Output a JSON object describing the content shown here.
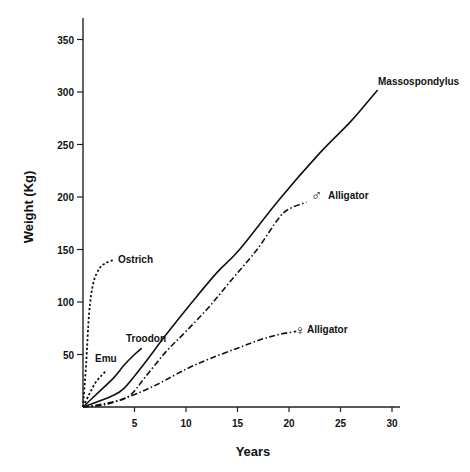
{
  "chart_data": {
    "type": "line",
    "title": "",
    "xlabel": "Years",
    "ylabel": "Weight (Kg)",
    "xlim": [
      0,
      31
    ],
    "ylim": [
      0,
      360
    ],
    "xticks": [
      5,
      10,
      15,
      20,
      25,
      30
    ],
    "yticks": [
      50,
      100,
      150,
      200,
      250,
      300,
      350
    ],
    "grid": false,
    "legend": "inline labels at curve ends",
    "series": [
      {
        "name": "Ostrich",
        "style": "dotted",
        "points": [
          [
            0,
            0
          ],
          [
            0.3,
            40
          ],
          [
            0.6,
            90
          ],
          [
            1.0,
            118
          ],
          [
            1.6,
            132
          ],
          [
            2.2,
            137
          ],
          [
            2.9,
            140
          ]
        ]
      },
      {
        "name": "Emu",
        "style": "dotted",
        "points": [
          [
            0,
            0
          ],
          [
            0.6,
            12
          ],
          [
            1.2,
            23
          ],
          [
            1.8,
            30
          ],
          [
            2.3,
            35
          ]
        ]
      },
      {
        "name": "Troodon",
        "style": "solid",
        "points": [
          [
            0,
            0
          ],
          [
            1.5,
            14
          ],
          [
            3,
            28
          ],
          [
            4,
            40
          ],
          [
            5,
            50
          ],
          [
            5.7,
            56
          ]
        ]
      },
      {
        "name": "Massospondylus",
        "style": "solid",
        "points": [
          [
            0,
            0
          ],
          [
            2.7,
            10
          ],
          [
            4,
            18
          ],
          [
            6,
            42
          ],
          [
            8,
            68
          ],
          [
            10.6,
            100
          ],
          [
            13,
            128
          ],
          [
            15.2,
            150
          ],
          [
            19,
            197
          ],
          [
            23,
            242
          ],
          [
            26,
            272
          ],
          [
            28.6,
            302
          ]
        ]
      },
      {
        "name": "♂ Alligator",
        "style": "dash-dot",
        "points": [
          [
            0,
            0
          ],
          [
            2,
            3
          ],
          [
            4.4,
            10
          ],
          [
            6,
            28
          ],
          [
            8,
            52
          ],
          [
            10,
            72
          ],
          [
            12.3,
            96
          ],
          [
            14.5,
            122
          ],
          [
            16.9,
            150
          ],
          [
            19.1,
            181
          ],
          [
            20.3,
            190
          ],
          [
            21.7,
            195
          ]
        ]
      },
      {
        "name": "♀ Alligator",
        "style": "dash-dot",
        "points": [
          [
            0,
            0
          ],
          [
            2,
            2
          ],
          [
            4,
            8
          ],
          [
            6,
            16
          ],
          [
            7.5,
            23
          ],
          [
            10,
            36
          ],
          [
            12.3,
            46
          ],
          [
            15,
            56
          ],
          [
            17.2,
            64
          ],
          [
            19,
            69
          ],
          [
            20.7,
            72
          ]
        ]
      }
    ],
    "annotations": [
      {
        "text": "Ostrich",
        "x": 3.4,
        "y": 140
      },
      {
        "text": "Emu",
        "x": 1.2,
        "y": 46
      },
      {
        "text": "Troodon",
        "x": 4.2,
        "y": 64
      },
      {
        "text": "Massospondylus",
        "x": 29,
        "y": 311
      },
      {
        "text": "Alligator",
        "x": 23.8,
        "y": 199,
        "symbol": "♂"
      },
      {
        "text": "Alligator",
        "x": 22,
        "y": 72,
        "symbol": "♀"
      }
    ]
  },
  "labels": {
    "xlabel": "Years",
    "ylabel": "Weight (Kg)",
    "ostrich": "Ostrich",
    "emu": "Emu",
    "troodon": "Troodon",
    "masso": "Massospondylus",
    "male_symbol": "♂",
    "male_alligator": "Alligator",
    "female_symbol": "♀",
    "female_alligator": "Alligator"
  }
}
